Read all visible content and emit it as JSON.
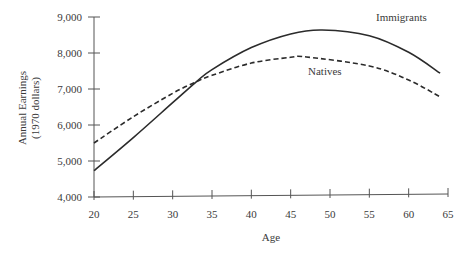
{
  "chart_data": {
    "type": "line",
    "title": "",
    "xlabel": "Age",
    "ylabel": "Annual Earnings",
    "ylabel_sub": "(1970 dollars)",
    "xlim": [
      20,
      65
    ],
    "ylim": [
      4000,
      9000
    ],
    "xticks": [
      20,
      25,
      30,
      35,
      40,
      45,
      50,
      55,
      60,
      65
    ],
    "yticks": [
      4000,
      5000,
      6000,
      7000,
      8000,
      9000
    ],
    "ytick_labels": [
      "4,000",
      "5,000",
      "6,000",
      "7,000",
      "8,000",
      "9,000"
    ],
    "grid": false,
    "legend_position": "inline labels",
    "series": [
      {
        "name": "Immigrants",
        "style": "solid",
        "x": [
          20,
          25,
          30,
          33,
          35,
          40,
          45,
          49,
          55,
          60,
          64
        ],
        "values": [
          4730,
          5650,
          6620,
          7200,
          7540,
          8150,
          8530,
          8640,
          8480,
          8020,
          7440
        ]
      },
      {
        "name": "Natives",
        "style": "dashed",
        "x": [
          20,
          25,
          30,
          33,
          35,
          40,
          45,
          47,
          55,
          60,
          64
        ],
        "values": [
          5500,
          6230,
          6880,
          7200,
          7380,
          7720,
          7880,
          7890,
          7640,
          7250,
          6780
        ]
      }
    ],
    "annotations": [
      {
        "text": "Immigrants",
        "x": 55,
        "y": 8800
      },
      {
        "text": "Natives",
        "x": 51,
        "y": 7680
      }
    ]
  }
}
